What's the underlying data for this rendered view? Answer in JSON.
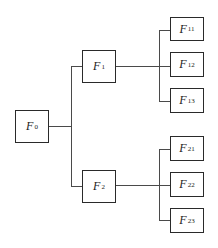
{
  "diagram": {
    "type": "tree",
    "root": {
      "id": "F0",
      "label": "F",
      "sub": "0",
      "children": [
        {
          "id": "F1",
          "label": "F",
          "sub": "1",
          "children": [
            {
              "id": "F11",
              "label": "F",
              "sub": "11"
            },
            {
              "id": "F12",
              "label": "F",
              "sub": "12"
            },
            {
              "id": "F13",
              "label": "F",
              "sub": "13"
            }
          ]
        },
        {
          "id": "F2",
          "label": "F",
          "sub": "2",
          "children": [
            {
              "id": "F21",
              "label": "F",
              "sub": "21"
            },
            {
              "id": "F22",
              "label": "F",
              "sub": "22"
            },
            {
              "id": "F23",
              "label": "F",
              "sub": "23"
            }
          ]
        }
      ]
    },
    "nodes": {
      "f0": {
        "label": "F",
        "sub": "0"
      },
      "f1": {
        "label": "F",
        "sub": "1"
      },
      "f2": {
        "label": "F",
        "sub": "2"
      },
      "f11": {
        "label": "F",
        "sub": "11"
      },
      "f12": {
        "label": "F",
        "sub": "12"
      },
      "f13": {
        "label": "F",
        "sub": "13"
      },
      "f21": {
        "label": "F",
        "sub": "21"
      },
      "f22": {
        "label": "F",
        "sub": "22"
      },
      "f23": {
        "label": "F",
        "sub": "23"
      }
    },
    "colors": {
      "stroke": "#2a2a2a",
      "connector": "#4a4a4a",
      "background": "#ffffff"
    }
  }
}
